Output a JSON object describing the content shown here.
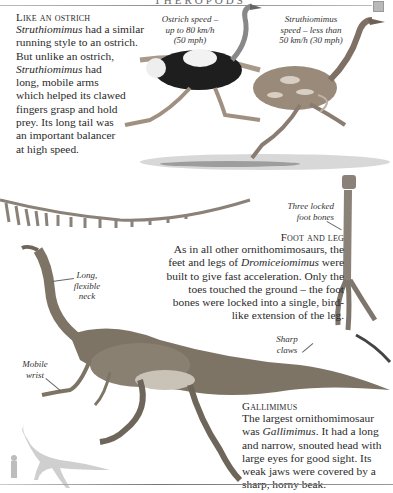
{
  "header": {
    "title": "THEROPODS",
    "corner_marker_color": "#b9b9b9"
  },
  "ostrich_section": {
    "heading": "Like an ostrich",
    "lines": [
      {
        "pre": "",
        "em": "Struthiomimus",
        "post": " had a similar"
      },
      {
        "pre": "running style to an ostrich.",
        "em": "",
        "post": ""
      },
      {
        "pre": "But unlike an ostrich,",
        "em": "",
        "post": ""
      },
      {
        "pre": "",
        "em": "Struthiomimus",
        "post": " had"
      },
      {
        "pre": "long, mobile arms",
        "em": "",
        "post": ""
      },
      {
        "pre": "which helped its clawed",
        "em": "",
        "post": ""
      },
      {
        "pre": "fingers grasp and hold",
        "em": "",
        "post": ""
      },
      {
        "pre": "prey. Its long tail was",
        "em": "",
        "post": ""
      },
      {
        "pre": "an important balancer",
        "em": "",
        "post": ""
      },
      {
        "pre": "at high speed.",
        "em": "",
        "post": ""
      }
    ],
    "caption_ostrich": [
      "Ostrich speed –",
      "up to 80 km/h",
      "(50 mph)"
    ],
    "caption_struthiomimus": [
      "Struthiomimus",
      "speed – less than",
      "50 km/h (30 mph)"
    ]
  },
  "foot_section": {
    "label_bones": [
      "Three locked",
      "foot bones"
    ],
    "heading": "Foot and leg",
    "lines": [
      {
        "pre": "As in all other ornithomimosaurs, the",
        "em": "",
        "post": ""
      },
      {
        "pre": "feet and legs of ",
        "em": "Dromiceiomimus",
        "post": " were"
      },
      {
        "pre": "built to give fast acceleration. Only the",
        "em": "",
        "post": ""
      },
      {
        "pre": "toes touched the ground – the foot",
        "em": "",
        "post": ""
      },
      {
        "pre": "bones were locked into a single, bird-",
        "em": "",
        "post": ""
      },
      {
        "pre": "like extension of the leg.",
        "em": "",
        "post": ""
      }
    ],
    "label_claws": [
      "Sharp",
      "claws"
    ]
  },
  "gallimimus_section": {
    "label_neck": [
      "Long,",
      "flexible",
      "neck"
    ],
    "label_wrist": [
      "Mobile",
      "wrist"
    ],
    "heading": "Gallimimus",
    "lines": [
      {
        "pre": "The largest ornithomimosaur",
        "em": "",
        "post": ""
      },
      {
        "pre": "was ",
        "em": "Gallimimus",
        "post": ". It had a long"
      },
      {
        "pre": "and narrow, snouted head with",
        "em": "",
        "post": ""
      },
      {
        "pre": "large eyes for good sight. Its",
        "em": "",
        "post": ""
      },
      {
        "pre": "weak jaws were covered by a",
        "em": "",
        "post": ""
      },
      {
        "pre": "sharp, horny beak.",
        "em": "",
        "post": ""
      }
    ]
  },
  "colors": {
    "text": "#2a2a2a",
    "ostrich_black": "#1e1e1e",
    "struthiomimus_skin": "#9a8a7a",
    "gallimimus_body": "#7d7466",
    "silhouette": "#cfcfcf",
    "bone": "#8a8178"
  }
}
